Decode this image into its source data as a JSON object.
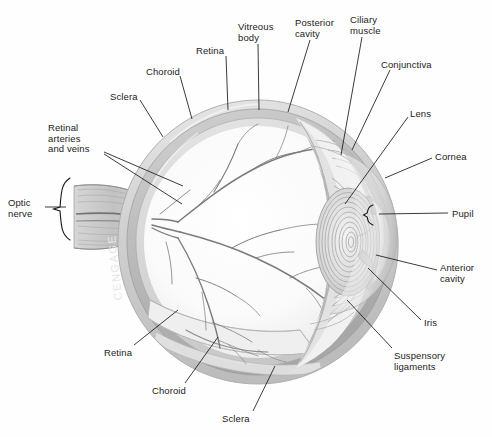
{
  "figure": {
    "background_color": "#ffffff",
    "label_color": "#1c1c1c",
    "leader_line_color": "#1a1a1a",
    "watermark_text": "CENGAGE"
  },
  "labels": [
    {
      "id": "retinal-arteries-and-veins",
      "text": "Retinal\narteries\nand veins",
      "x": 48,
      "y": 123,
      "align": "l"
    },
    {
      "id": "sclera-top",
      "text": "Sclera",
      "x": 110,
      "y": 92,
      "align": "l"
    },
    {
      "id": "choroid-top",
      "text": "Choroid",
      "x": 146,
      "y": 67,
      "align": "l"
    },
    {
      "id": "retina-top",
      "text": "Retina",
      "x": 196,
      "y": 46,
      "align": "l"
    },
    {
      "id": "vitreous-body",
      "text": "Vitreous\nbody",
      "x": 238,
      "y": 22,
      "align": "l"
    },
    {
      "id": "posterior-cavity",
      "text": "Posterior\ncavity",
      "x": 295,
      "y": 18,
      "align": "l"
    },
    {
      "id": "ciliary-muscle",
      "text": "Ciliary\nmuscle",
      "x": 350,
      "y": 15,
      "align": "l"
    },
    {
      "id": "conjunctiva",
      "text": "Conjunctiva",
      "x": 381,
      "y": 60,
      "align": "l"
    },
    {
      "id": "lens",
      "text": "Lens",
      "x": 410,
      "y": 109,
      "align": "l"
    },
    {
      "id": "cornea",
      "text": "Cornea",
      "x": 435,
      "y": 152,
      "align": "l"
    },
    {
      "id": "pupil",
      "text": "Pupil",
      "x": 452,
      "y": 209,
      "align": "l"
    },
    {
      "id": "anterior-cavity",
      "text": "Anterior\ncavity",
      "x": 440,
      "y": 263,
      "align": "l"
    },
    {
      "id": "iris",
      "text": "Iris",
      "x": 424,
      "y": 318,
      "align": "l"
    },
    {
      "id": "suspensory-ligaments",
      "text": "Suspensory\nligaments",
      "x": 394,
      "y": 351,
      "align": "l"
    },
    {
      "id": "optic-nerve",
      "text": "Optic\nnerve",
      "x": 8,
      "y": 198,
      "align": "l"
    },
    {
      "id": "retina-bottom",
      "text": "Retina",
      "x": 104,
      "y": 348,
      "align": "l"
    },
    {
      "id": "choroid-bottom",
      "text": "Choroid",
      "x": 152,
      "y": 386,
      "align": "l"
    },
    {
      "id": "sclera-bottom",
      "text": "Sclera",
      "x": 222,
      "y": 414,
      "align": "l"
    }
  ],
  "leaders": [
    {
      "id": "leader-retinal-vessels-a",
      "x1": 104,
      "y1": 152,
      "x2": 183,
      "y2": 186
    },
    {
      "id": "leader-retinal-vessels-b",
      "x1": 104,
      "y1": 154,
      "x2": 182,
      "y2": 204
    },
    {
      "id": "leader-sclera-top",
      "x1": 140,
      "y1": 100,
      "x2": 163,
      "y2": 137
    },
    {
      "id": "leader-choroid-top",
      "x1": 180,
      "y1": 76,
      "x2": 192,
      "y2": 119
    },
    {
      "id": "leader-retina-top",
      "x1": 226,
      "y1": 56,
      "x2": 228,
      "y2": 110
    },
    {
      "id": "leader-vitreous-body",
      "x1": 258,
      "y1": 44,
      "x2": 259,
      "y2": 110
    },
    {
      "id": "leader-posterior-cavity",
      "x1": 310,
      "y1": 40,
      "x2": 288,
      "y2": 112
    },
    {
      "id": "leader-ciliary-muscle",
      "x1": 362,
      "y1": 37,
      "x2": 341,
      "y2": 155
    },
    {
      "id": "leader-conjunctiva",
      "x1": 390,
      "y1": 70,
      "x2": 352,
      "y2": 150
    },
    {
      "id": "leader-lens",
      "x1": 408,
      "y1": 117,
      "x2": 345,
      "y2": 204
    },
    {
      "id": "leader-cornea",
      "x1": 432,
      "y1": 158,
      "x2": 385,
      "y2": 178
    },
    {
      "id": "leader-pupil",
      "x1": 448,
      "y1": 213,
      "x2": 379,
      "y2": 214
    },
    {
      "id": "leader-anterior-cavity",
      "x1": 437,
      "y1": 270,
      "x2": 376,
      "y2": 255
    },
    {
      "id": "leader-iris",
      "x1": 421,
      "y1": 320,
      "x2": 368,
      "y2": 268
    },
    {
      "id": "leader-suspensory-ligaments",
      "x1": 392,
      "y1": 348,
      "x2": 347,
      "y2": 300
    },
    {
      "id": "leader-optic-nerve",
      "x1": 45,
      "y1": 207,
      "x2": 66,
      "y2": 207
    },
    {
      "id": "leader-retina-bottom",
      "x1": 134,
      "y1": 345,
      "x2": 178,
      "y2": 310
    },
    {
      "id": "leader-choroid-bottom",
      "x1": 185,
      "y1": 383,
      "x2": 218,
      "y2": 337
    },
    {
      "id": "leader-sclera-bottom",
      "x1": 253,
      "y1": 411,
      "x2": 275,
      "y2": 366
    }
  ],
  "braces": [
    {
      "id": "optic-nerve-brace",
      "x": 70,
      "y_top": 178,
      "y_bottom": 240
    },
    {
      "id": "pupil-brace",
      "x": 373,
      "y_top": 205,
      "y_bottom": 225
    }
  ],
  "structures": [
    {
      "id": "sclera-wall",
      "name": "Sclera",
      "color": "#d8d8d8"
    },
    {
      "id": "choroid-wall",
      "name": "Choroid",
      "color": "#bdbdbd"
    },
    {
      "id": "retina-wall",
      "name": "Retina",
      "color": "#cfcfcf"
    },
    {
      "id": "vitreous-chamber",
      "name": "Vitreous body",
      "color": "#fbfbfb"
    },
    {
      "id": "lens-body",
      "name": "Lens",
      "color": "#e2e2e2"
    },
    {
      "id": "cornea-dome",
      "name": "Cornea",
      "color": "#ededed"
    },
    {
      "id": "iris-body",
      "name": "Iris",
      "color": "#c9c9c9"
    },
    {
      "id": "ciliary-striations",
      "name": "Ciliary muscle",
      "color": "#b5b5b5"
    },
    {
      "id": "optic-nerve-bundle",
      "name": "Optic nerve",
      "color": "#cccccc"
    },
    {
      "id": "retinal-vessel-tree",
      "name": "Retinal arteries and veins",
      "color": "#8c8c8c"
    }
  ]
}
